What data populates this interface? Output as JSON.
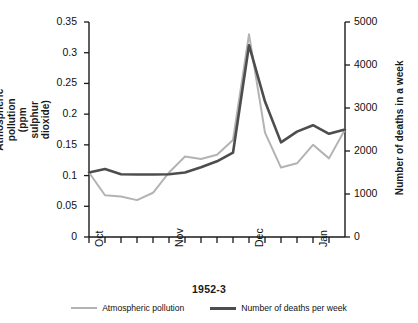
{
  "chart_data": {
    "type": "line",
    "title": "",
    "xlabel": "1952-3",
    "x_tick_labels": [
      "Oct",
      "",
      "",
      "",
      "",
      "Nov",
      "",
      "",
      "",
      "",
      "Dec",
      "",
      "",
      "",
      "Jan",
      ""
    ],
    "x_index": [
      0,
      1,
      2,
      3,
      4,
      5,
      6,
      7,
      8,
      9,
      10,
      11,
      12,
      13,
      14,
      15
    ],
    "grid": false,
    "legend_position": "bottom-center",
    "axes": {
      "left": {
        "label": "Atmospheric pollution\n(ppm sulphur dioxide)",
        "ticks": [
          "0",
          "0.05",
          "0.1",
          "0.15",
          "0.2",
          "0.25",
          "0.3",
          "0.35"
        ],
        "tick_values": [
          0,
          0.05,
          0.1,
          0.15,
          0.2,
          0.25,
          0.3,
          0.35
        ],
        "ylim": [
          0,
          0.35
        ]
      },
      "right": {
        "label": "Number of deaths in a week",
        "ticks": [
          "0",
          "1000",
          "2000",
          "3000",
          "4000",
          "5000"
        ],
        "tick_values": [
          0,
          1000,
          2000,
          3000,
          4000,
          5000
        ],
        "ylim": [
          0,
          5000
        ]
      }
    },
    "series": [
      {
        "name": "Atmospheric pollution",
        "axis": "left",
        "unit": "ppm sulphur dioxide",
        "color": "#b3b3b3",
        "line_width": 2,
        "values": [
          0.105,
          0.068,
          0.066,
          0.06,
          0.072,
          0.105,
          0.131,
          0.127,
          0.134,
          0.158,
          0.33,
          0.17,
          0.113,
          0.12,
          0.15,
          0.128,
          0.175
        ]
      },
      {
        "name": "Number of deaths per week",
        "axis": "right",
        "unit": "deaths per week",
        "color": "#4d4d4d",
        "line_width": 2.6,
        "values": [
          1500,
          1580,
          1460,
          1455,
          1455,
          1460,
          1500,
          1620,
          1760,
          1960,
          4460,
          3150,
          2200,
          2450,
          2600,
          2400,
          2500
        ]
      }
    ],
    "annotations": []
  },
  "legend": {
    "items": [
      {
        "label": "Atmospheric pollution",
        "color": "#b3b3b3"
      },
      {
        "label": "Number of deaths per week",
        "color": "#4d4d4d"
      }
    ]
  }
}
